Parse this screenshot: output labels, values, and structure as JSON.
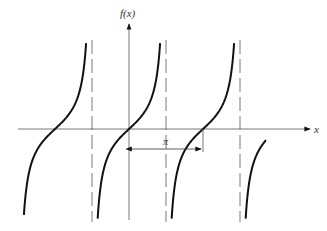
{
  "diagram": {
    "function": "tan",
    "y_axis_label": "f(x)",
    "x_axis_label": "x",
    "period_label": "π",
    "colors": {
      "curve": "#111111",
      "axis": "#444444",
      "asymptote": "#555555"
    },
    "branches": 4,
    "asymptotes": 3
  }
}
